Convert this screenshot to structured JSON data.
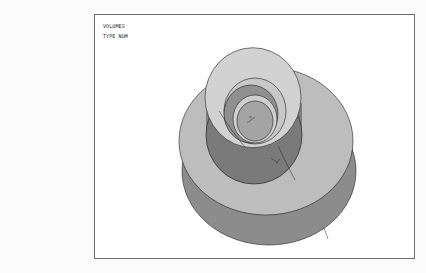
{
  "figure": {
    "labels": {
      "line1": "VOLUMES",
      "line2": "TYPE NUM"
    },
    "object": "3d-volume-render-stepped-hub-disk",
    "colors": {
      "frame_border": "#6e6e6e",
      "top_face": "#bdbdbd",
      "ring_face": "#d2d2d2",
      "side_wall": "#7a7a7a",
      "rim": "#8c8c8c",
      "bore_inner": "#909090",
      "bore_floor": "#a4a4a4",
      "outline": "#1e1e1e"
    }
  }
}
